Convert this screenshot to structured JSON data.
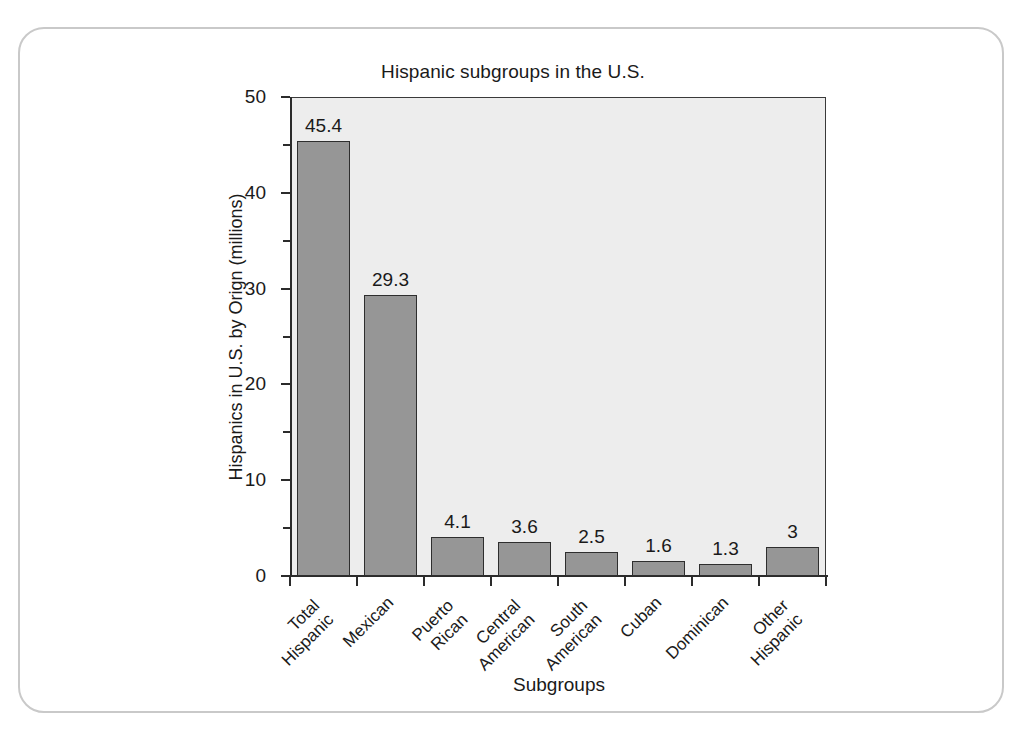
{
  "chart_data": {
    "type": "bar",
    "title": "Hispanic subgroups in the U.S.",
    "xlabel": "Subgroups",
    "ylabel": "Hispanics in U.S. by Orign (millions)",
    "categories": [
      "Total Hispanic",
      "Mexican",
      "Puerto Rican",
      "Central American",
      "South American",
      "Cuban",
      "Dominican",
      "Other Hispanic"
    ],
    "category_lines": [
      [
        "Total",
        "Hispanic"
      ],
      [
        "Mexican"
      ],
      [
        "Puerto",
        "Rican"
      ],
      [
        "Central",
        "American"
      ],
      [
        "South",
        "American"
      ],
      [
        "Cuban"
      ],
      [
        "Dominican"
      ],
      [
        "Other",
        "Hispanic"
      ]
    ],
    "values": [
      45.4,
      29.3,
      4.1,
      3.6,
      2.5,
      1.6,
      1.3,
      3
    ],
    "value_labels": [
      "45.4",
      "29.3",
      "4.1",
      "3.6",
      "2.5",
      "1.6",
      "1.3",
      "3"
    ],
    "ylim": [
      0,
      50
    ],
    "ytick_labels": [
      "50",
      "40",
      "30",
      "20",
      "10",
      "0"
    ],
    "ytick_values": [
      50,
      40,
      30,
      20,
      10,
      0
    ],
    "yminor_values": [
      45,
      35,
      25,
      15,
      5
    ],
    "grid": false,
    "legend": "none",
    "colors": {
      "bar_fill": "#969696",
      "bar_border": "#2e2e2e",
      "plot_background": "#ededed",
      "axis": "#2b2b2b",
      "text": "#1a1a1a",
      "card_border": "#c9c9c9",
      "page_background": "#ffffff"
    }
  }
}
